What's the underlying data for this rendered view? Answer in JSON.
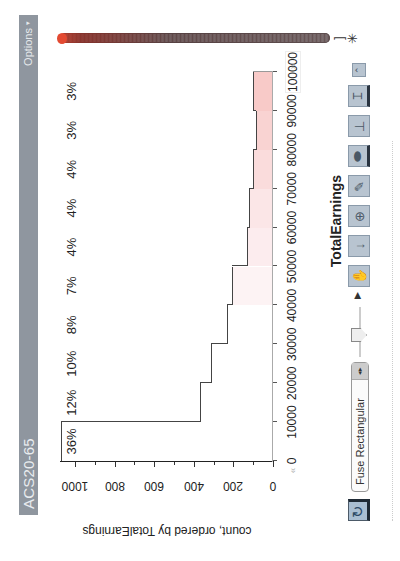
{
  "header": {
    "title": "ACS20-65",
    "options_label": "Options",
    "options_caret": "▾"
  },
  "slider": {
    "cap_glyph": "]",
    "star_glyph": "✳"
  },
  "chart_data": {
    "type": "bar",
    "title": "",
    "xlabel": "TotalEarnings",
    "ylabel": "count, ordered by TotalEarnings",
    "x_ticks": [
      "0",
      "10000",
      "20000",
      "30000",
      "40000",
      "50000",
      "60000",
      "70000",
      "80000",
      "90000",
      "100000"
    ],
    "y_ticks": [
      "0",
      "200",
      "400",
      "600",
      "800",
      "1000"
    ],
    "ylim": [
      0,
      1070
    ],
    "xlim": [
      0,
      100000
    ],
    "categories": [
      "0-10000",
      "10000-20000",
      "20000-30000",
      "30000-40000",
      "40000-50000",
      "50000-60000",
      "60000-70000",
      "70000-80000",
      "80000-90000",
      "90000-100000"
    ],
    "values": [
      1070,
      370,
      315,
      230,
      205,
      130,
      120,
      100,
      85,
      100
    ],
    "percent_labels": [
      "36%",
      "12%",
      "10%",
      "8%",
      "7%",
      "4%",
      "4%",
      "4%",
      "3%",
      "3%"
    ],
    "fill_colors": [
      "#ffffff",
      "#ffffff",
      "#ffffff",
      "#ffffff",
      "#fdf3f4",
      "#fcecee",
      "#fbe6e7",
      "#fadcdc",
      "#f9d3d2",
      "#f8cac8"
    ],
    "grid": false,
    "legend": "none"
  },
  "nav": {
    "x_left": "«",
    "x_right": "»"
  },
  "toolbar": {
    "refresh_glyph": "↻",
    "fuse_select_value": "Fuse Rectangular",
    "fuse_arrows": "◂▸",
    "play_glyph": "▶",
    "buttons": [
      {
        "name": "grab-icon",
        "glyph": "✋"
      },
      {
        "name": "arrow-down-icon",
        "glyph": "↓"
      },
      {
        "name": "add-point-icon",
        "glyph": "⊕"
      },
      {
        "name": "pencil-icon",
        "glyph": "✎"
      },
      {
        "name": "eraser-icon",
        "glyph": "⬬"
      },
      {
        "name": "paintbrush-icon",
        "glyph": "⊥"
      },
      {
        "name": "histogram-icon",
        "glyph": "⌶"
      },
      {
        "name": "expand-icon",
        "glyph": "⌃"
      }
    ]
  }
}
